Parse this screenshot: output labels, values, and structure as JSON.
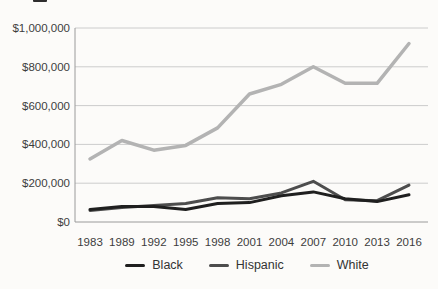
{
  "figure": {
    "background": "#fcfbf9",
    "grid_color": "#cccccc",
    "axis_color": "#9a9a9a",
    "tick_text_color": "#3d3d3d"
  },
  "chart_data": {
    "type": "line",
    "title": "",
    "xlabel": "",
    "ylabel": "",
    "x_categories": [
      "1983",
      "1989",
      "1992",
      "1995",
      "1998",
      "2001",
      "2004",
      "2007",
      "2010",
      "2013",
      "2016"
    ],
    "series": [
      {
        "name": "Black",
        "color": "#1f1f1f",
        "stroke_width": 3,
        "values": [
          65000,
          80000,
          80000,
          65000,
          95000,
          100000,
          135000,
          155000,
          120000,
          105000,
          140000
        ]
      },
      {
        "name": "Hispanic",
        "color": "#4d4d4d",
        "stroke_width": 3,
        "values": [
          60000,
          75000,
          85000,
          95000,
          125000,
          120000,
          150000,
          210000,
          115000,
          110000,
          190000
        ]
      },
      {
        "name": "White",
        "color": "#b3b3b3",
        "stroke_width": 3.5,
        "values": [
          325000,
          420000,
          370000,
          395000,
          485000,
          660000,
          710000,
          800000,
          715000,
          715000,
          920000
        ]
      }
    ],
    "y_ticks": [
      {
        "value": 1000000,
        "label": "$1,000,000"
      },
      {
        "value": 800000,
        "label": "$800,000"
      },
      {
        "value": 600000,
        "label": "$600,000"
      },
      {
        "value": 400000,
        "label": "$400,000"
      },
      {
        "value": 200000,
        "label": "$200,000"
      },
      {
        "value": 0,
        "label": "$0"
      }
    ],
    "ylim": [
      0,
      1000000
    ],
    "grid": "horizontal",
    "legend_position": "bottom",
    "legend_order": [
      "Black",
      "Hispanic",
      "White"
    ]
  }
}
